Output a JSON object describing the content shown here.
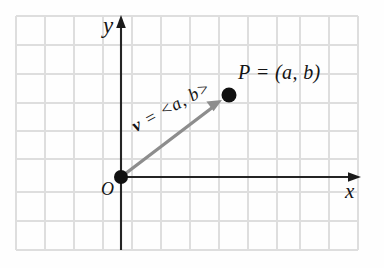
{
  "figure": {
    "background_color": "#fefefe",
    "grid": {
      "line_color": "#dedede",
      "cell_width": 29,
      "cell_height": 28,
      "left": 16,
      "top": 16,
      "right": 358,
      "bottom": 250,
      "columns": 12,
      "rows": 8,
      "visible": true
    },
    "axes": {
      "color": "#1a1a1a",
      "x_axis_label": "x",
      "y_axis_label": "y",
      "origin_label": "O",
      "x_axis_y": 177,
      "y_axis_x": 121,
      "x_arrow_tip": 360,
      "y_arrow_tip": 18
    },
    "vector": {
      "color": "#8a8a8a",
      "label_v": "v",
      "label_rest": " = <a, b>",
      "from": "O",
      "to": "P",
      "start_x": 121,
      "start_y": 177,
      "end_x": 229,
      "end_y": 95,
      "rotation_deg": -28.5
    },
    "point": {
      "label": "P = (a, b)",
      "name": "P",
      "coordinates": "(a, b)",
      "dot_color": "#111111",
      "x": 229,
      "y": 95,
      "radius": 7
    },
    "origin_point": {
      "label": "O",
      "dot_color": "#111111",
      "x": 121,
      "y": 177,
      "radius": 7
    }
  }
}
